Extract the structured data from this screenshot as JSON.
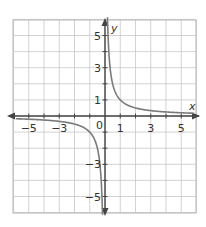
{
  "chart_data": {
    "type": "line",
    "title": "",
    "function": "y = 1/x",
    "xlabel": "x",
    "ylabel": "y",
    "xlim": [
      -6,
      6
    ],
    "ylim": [
      -6,
      6
    ],
    "grid": true,
    "legend": null,
    "x_tick_labels": [
      "−5",
      "−3",
      "1",
      "3",
      "5"
    ],
    "x_tick_values": [
      -5,
      -3,
      1,
      3,
      5
    ],
    "y_tick_labels": [
      "5",
      "3",
      "1",
      "−3",
      "−5"
    ],
    "y_tick_values": [
      5,
      3,
      1,
      -3,
      -5
    ],
    "origin_label": "0",
    "series": [
      {
        "name": "right branch",
        "x": [
          0.17,
          0.2,
          0.25,
          0.33,
          0.5,
          0.75,
          1,
          1.5,
          2,
          3,
          4,
          5,
          5.8
        ],
        "y": [
          5.9,
          5,
          4,
          3,
          2,
          1.33,
          1,
          0.67,
          0.5,
          0.33,
          0.25,
          0.2,
          0.17
        ]
      },
      {
        "name": "left branch",
        "x": [
          -5.8,
          -5,
          -4,
          -3,
          -2,
          -1.5,
          -1,
          -0.75,
          -0.5,
          -0.33,
          -0.25,
          -0.2,
          -0.17
        ],
        "y": [
          -0.17,
          -0.2,
          -0.25,
          -0.33,
          -0.5,
          -0.67,
          -1,
          -1.33,
          -2,
          -3,
          -4,
          -5,
          -5.9
        ]
      }
    ],
    "colors": {
      "curve": "#7a7a7a",
      "axis": "#444444",
      "grid": "#c8c8c8",
      "border": "#b5b5b5"
    }
  }
}
